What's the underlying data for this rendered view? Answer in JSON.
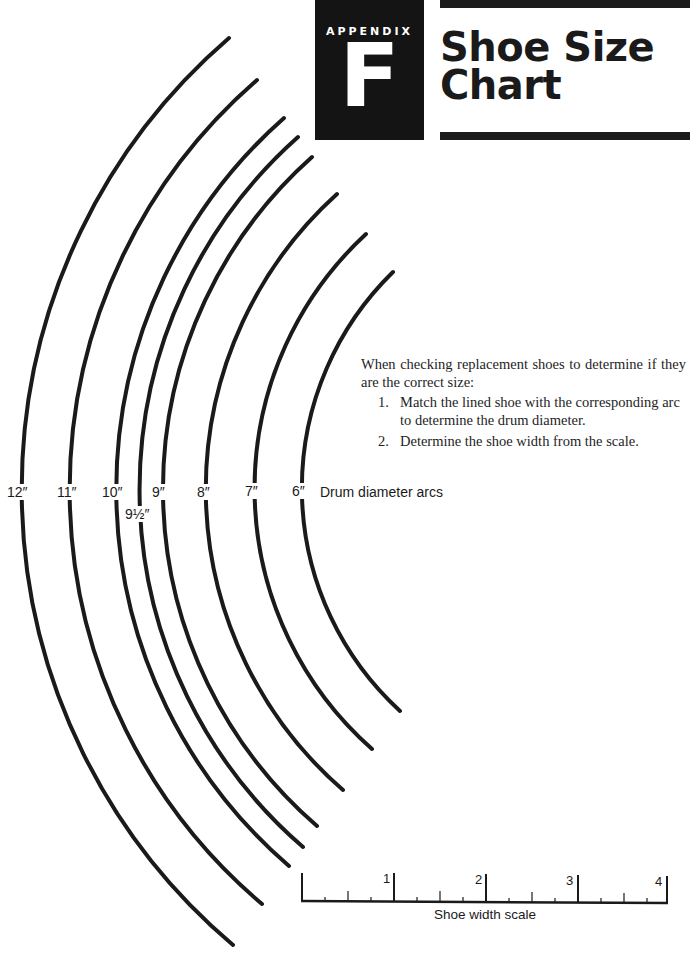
{
  "header": {
    "appendix_label": "APPENDIX",
    "appendix_letter": "F",
    "title_line1": "Shoe Size",
    "title_line2": "Chart"
  },
  "instructions": {
    "intro": "When checking replacement shoes to determine if they are the correct size:",
    "steps": [
      {
        "num": "1.",
        "text": "Match the lined shoe with the corresponding arc to determine the drum diameter."
      },
      {
        "num": "2.",
        "text": "Determine the shoe width from the scale."
      }
    ]
  },
  "arcs": {
    "legend": "Drum diameter arcs",
    "labels": [
      {
        "id": "12",
        "text": "12″"
      },
      {
        "id": "11",
        "text": "11″"
      },
      {
        "id": "10",
        "text": "10″"
      },
      {
        "id": "9-5",
        "text": "9½″"
      },
      {
        "id": "9",
        "text": "9″"
      },
      {
        "id": "8",
        "text": "8″"
      },
      {
        "id": "7",
        "text": "7″"
      },
      {
        "id": "6",
        "text": "6″"
      }
    ]
  },
  "scale": {
    "caption": "Shoe width scale",
    "major_ticks": [
      "1",
      "2",
      "3",
      "4"
    ]
  },
  "colors": {
    "ink": "#1a1a1a",
    "paper": "#ffffff"
  }
}
